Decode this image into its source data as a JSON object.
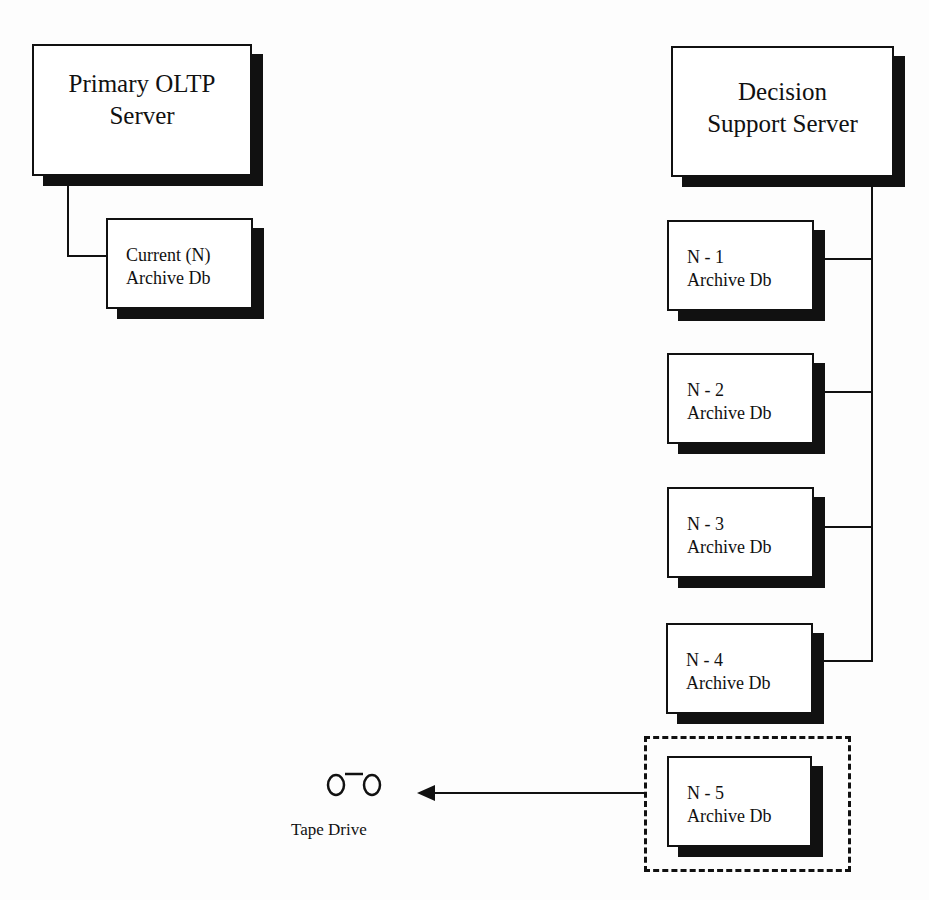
{
  "diagram": {
    "primary_server": {
      "line1": "Primary OLTP",
      "line2": "Server"
    },
    "current_archive": {
      "line1": "Current (N)",
      "line2": "Archive Db"
    },
    "decision_server": {
      "line1": "Decision",
      "line2": "Support Server"
    },
    "archives": [
      {
        "line1": "N - 1",
        "line2": "Archive Db"
      },
      {
        "line1": "N - 2",
        "line2": "Archive Db"
      },
      {
        "line1": "N - 3",
        "line2": "Archive Db"
      },
      {
        "line1": "N - 4",
        "line2": "Archive Db"
      },
      {
        "line1": "N - 5",
        "line2": "Archive Db"
      }
    ],
    "tape_drive": {
      "label": "Tape Drive",
      "icon": "tape-reel-icon"
    },
    "colors": {
      "stroke": "#111111",
      "fill": "#ffffff",
      "background": "#fdfdfd"
    }
  }
}
